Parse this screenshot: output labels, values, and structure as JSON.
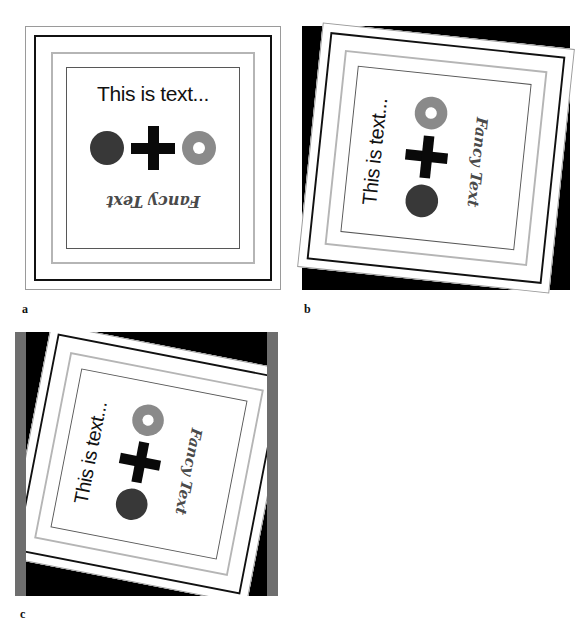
{
  "figure": {
    "panel_count": 4,
    "background": "#ffffff"
  },
  "card": {
    "headline": "This is text...",
    "fancy_text": "Fancy Text",
    "shapes": [
      {
        "name": "filled-disc",
        "color": "#383838"
      },
      {
        "name": "plus-cross",
        "color": "#090909"
      },
      {
        "name": "annulus-ring",
        "color": "#8a8a8a",
        "hole_color": "#ffffff"
      }
    ],
    "frames": [
      {
        "name": "outer-hairline",
        "color": "#9a9a9a"
      },
      {
        "name": "black-border",
        "color": "#111111"
      },
      {
        "name": "light-gray-border",
        "color": "#b5b5b5"
      },
      {
        "name": "inner-thin-border",
        "color": "#575757"
      }
    ]
  },
  "panels": [
    {
      "id": "a",
      "label": "a",
      "caption": "a",
      "transform": "reference (no rotation)",
      "background": "#ffffff"
    },
    {
      "id": "b",
      "label": "b",
      "caption": "b",
      "transform": "rotated ~84 degrees",
      "background": "#000000"
    },
    {
      "id": "c",
      "label": "c",
      "caption": "c",
      "transform": "rotated ~79 degrees with gray side bars",
      "background": "#000000",
      "bar_color": "#6e6e6e"
    },
    {
      "id": "d",
      "label": "d",
      "caption": "d",
      "transform": "perspective skew (diamond)",
      "background": "#6e6e6e"
    }
  ],
  "colors": {
    "page_background": "#ffffff",
    "ink": "#111111",
    "dark_disc": "#383838",
    "gray_ring": "#8a8a8a",
    "gray_bar": "#6e6e6e",
    "black_field": "#000000"
  }
}
